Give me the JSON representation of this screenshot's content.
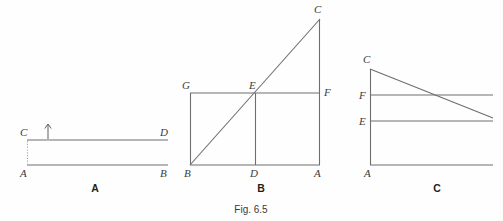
{
  "figure": {
    "caption": "Fig. 6.5",
    "background_color": "#fefefe",
    "line_color": "#6e6e6e",
    "label_color": "#3b3b3b"
  },
  "panels": [
    {
      "id": "panel-a",
      "label": "A",
      "label_position": {
        "x": 95,
        "y": 192
      },
      "vertices": [
        {
          "name": "C",
          "label": "C",
          "x": 27,
          "y": 140,
          "label_x": 20,
          "label_y": 136
        },
        {
          "name": "D",
          "label": "D",
          "x": 168,
          "y": 140,
          "label_x": 162,
          "label_y": 136
        },
        {
          "name": "A",
          "label": "A",
          "x": 27,
          "y": 165,
          "label_x": 20,
          "label_y": 177
        },
        {
          "name": "B",
          "label": "B",
          "x": 168,
          "y": 165,
          "label_x": 162,
          "label_y": 177
        }
      ],
      "segments": [
        {
          "name": "segment-CD",
          "from": "C",
          "to": "D",
          "style": "solid"
        },
        {
          "name": "segment-AB",
          "from": "A",
          "to": "B",
          "style": "solid"
        },
        {
          "name": "segment-AC",
          "from": "A",
          "to": "C",
          "style": "dotted"
        }
      ],
      "annotations": [
        {
          "name": "up-arrow",
          "type": "arrow",
          "x": 48,
          "y_tail": 139,
          "y_head": 124
        }
      ]
    },
    {
      "id": "panel-b",
      "label": "B",
      "label_position": {
        "x": 261,
        "y": 192
      },
      "vertices": [
        {
          "name": "C",
          "label": "C",
          "x": 320,
          "y": 19,
          "label_x": 315,
          "label_y": 13
        },
        {
          "name": "G",
          "label": "G",
          "x": 190,
          "y": 93,
          "label_x": 183,
          "label_y": 89
        },
        {
          "name": "E",
          "label": "E",
          "x": 255,
          "y": 93,
          "label_x": 249,
          "label_y": 89
        },
        {
          "name": "F",
          "label": "F",
          "x": 320,
          "y": 93,
          "label_x": 325,
          "label_y": 96
        },
        {
          "name": "B",
          "label": "B",
          "x": 190,
          "y": 165,
          "label_x": 184,
          "label_y": 177
        },
        {
          "name": "D",
          "label": "D",
          "x": 255,
          "y": 165,
          "label_x": 249,
          "label_y": 177
        },
        {
          "name": "A",
          "label": "A",
          "x": 320,
          "y": 165,
          "label_x": 314,
          "label_y": 177
        }
      ],
      "segments": [
        {
          "name": "segment-GF",
          "from": "G",
          "to": "F",
          "style": "solid"
        },
        {
          "name": "segment-BA",
          "from": "B",
          "to": "A",
          "style": "solid"
        },
        {
          "name": "segment-BG",
          "from": "B",
          "to": "G",
          "style": "solid"
        },
        {
          "name": "segment-AC",
          "from": "A",
          "to": "C",
          "style": "solid"
        },
        {
          "name": "segment-DE",
          "from": "D",
          "to": "E",
          "style": "solid"
        },
        {
          "name": "segment-BC-diagonal",
          "from": "B",
          "to": "C",
          "style": "solid"
        }
      ],
      "annotations": []
    },
    {
      "id": "panel-c",
      "label": "C",
      "label_position": {
        "x": 437,
        "y": 192
      },
      "vertices": [
        {
          "name": "C",
          "label": "C",
          "x": 370,
          "y": 69,
          "label_x": 364,
          "label_y": 63
        },
        {
          "name": "F",
          "label": "F",
          "x": 370,
          "y": 95,
          "label_x": 359,
          "label_y": 99
        },
        {
          "name": "E",
          "label": "E",
          "x": 370,
          "y": 121,
          "label_x": 359,
          "label_y": 125
        },
        {
          "name": "A",
          "label": "A",
          "x": 370,
          "y": 165,
          "label_x": 364,
          "label_y": 177
        }
      ],
      "segments": [
        {
          "name": "segment-AC-vertical",
          "from": "A",
          "to": "C",
          "style": "solid"
        },
        {
          "name": "segment-F-horizontal",
          "from": "F",
          "to": "right-edge",
          "style": "solid",
          "x2": 493
        },
        {
          "name": "segment-E-horizontal",
          "from": "E",
          "to": "right-edge",
          "style": "solid",
          "x2": 493
        },
        {
          "name": "segment-A-horizontal",
          "from": "A",
          "to": "right-edge",
          "style": "solid",
          "x2": 493
        },
        {
          "name": "segment-C-diagonal",
          "from": "C",
          "to": "right-edge",
          "style": "solid",
          "x2": 493,
          "y2": 118
        }
      ],
      "annotations": []
    }
  ]
}
